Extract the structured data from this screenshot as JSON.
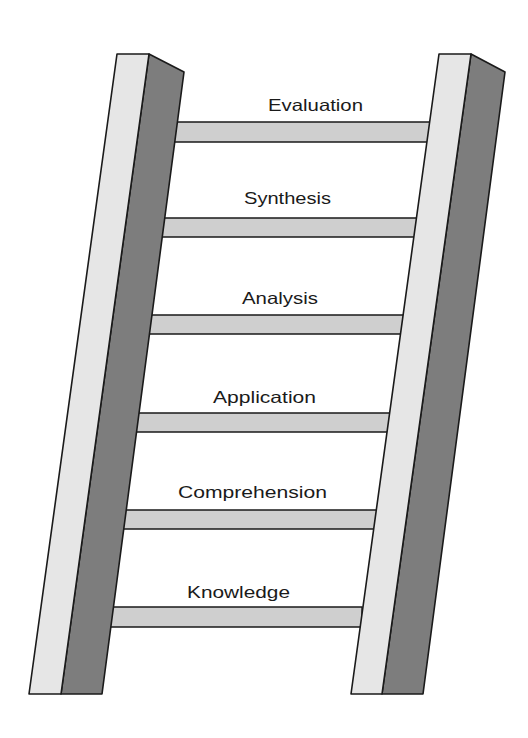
{
  "diagram": {
    "title": "",
    "type": "ladder",
    "colors": {
      "background": "#ffffff",
      "rail_light_face": "#e6e6e6",
      "rail_dark_face": "#7d7d7d",
      "rung_fill": "#cfcfcf",
      "outline": "#1a1a1a",
      "label_text": "#1a1a1a"
    },
    "rungs": [
      {
        "label": "Evaluation",
        "level": 6
      },
      {
        "label": "Synthesis",
        "level": 5
      },
      {
        "label": "Analysis",
        "level": 4
      },
      {
        "label": "Application",
        "level": 3
      },
      {
        "label": "Comprehension",
        "level": 2
      },
      {
        "label": "Knowledge",
        "level": 1
      }
    ]
  }
}
